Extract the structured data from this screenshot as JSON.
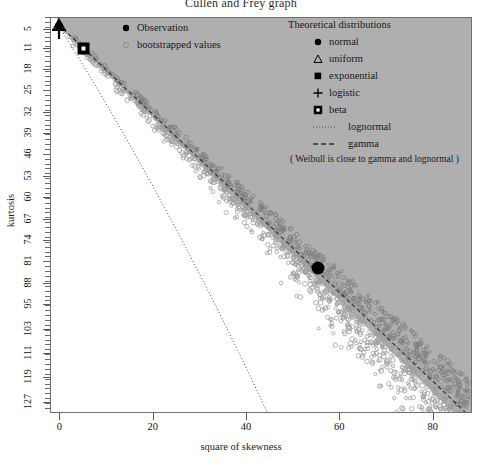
{
  "chart_data": {
    "type": "scatter",
    "title": "Cullen and Frey graph",
    "xlabel": "square of skewness",
    "ylabel": "kurtosis",
    "xlim": [
      -2,
      88
    ],
    "ylim": [
      127,
      1
    ],
    "grid": false,
    "xticks": [
      0,
      20,
      40,
      60,
      80
    ],
    "yticks": [
      5,
      11,
      18,
      25,
      32,
      39,
      46,
      53,
      60,
      67,
      74,
      81,
      88,
      95,
      103,
      111,
      119,
      127
    ],
    "y_axis_inverted": true,
    "series": [
      {
        "name": "Observation",
        "type": "point",
        "marker": "filled-circle",
        "color": "#000000",
        "points": [
          [
            51.5,
            79.5
          ]
        ]
      },
      {
        "name": "bootstrapped values",
        "type": "cloud",
        "marker": "open-circle",
        "color": "#9a9a9a",
        "n_points": 1000,
        "x_range": [
          4,
          82
        ],
        "y_range": [
          6,
          112
        ],
        "description": "elongated cloud of open grey circles running from upper-left near the origin down to the lower-right, hugging the gamma line"
      },
      {
        "name": "normal",
        "type": "point",
        "marker": "filled-circle",
        "color": "#000000",
        "points": [
          [
            0,
            3
          ]
        ]
      },
      {
        "name": "uniform",
        "type": "point",
        "marker": "open-triangle",
        "color": "#000000",
        "points": [
          [
            0,
            1.8
          ]
        ]
      },
      {
        "name": "exponential",
        "type": "point",
        "marker": "filled-square",
        "color": "#000000",
        "points": [
          [
            4,
            9
          ]
        ]
      },
      {
        "name": "logistic",
        "type": "point",
        "marker": "plus",
        "color": "#000000",
        "points": [
          [
            0,
            4.2
          ]
        ]
      },
      {
        "name": "beta",
        "type": "region",
        "marker": "square-with-dot",
        "color": "#a6a6a6",
        "description": "shaded grey wedge region bounded above by the frame and below by the gamma line"
      },
      {
        "name": "lognormal",
        "type": "line",
        "linestyle": "dotted",
        "color": "#555555",
        "description": "dotted curve descending steeply from near the origin to about x=43 at the bottom axis"
      },
      {
        "name": "gamma",
        "type": "line",
        "linestyle": "dashed",
        "color": "#333333",
        "description": "dashed line running from near the origin to the lower-right corner, forming the upper edge of the bootstrap cloud"
      }
    ]
  },
  "title": "Cullen and Frey graph",
  "axes": {
    "x": {
      "label": "square of skewness",
      "ticks": [
        "0",
        "20",
        "40",
        "60",
        "80"
      ]
    },
    "y": {
      "label": "kurtosis",
      "ticks": [
        "5",
        "11",
        "18",
        "25",
        "32",
        "39",
        "46",
        "53",
        "60",
        "67",
        "74",
        "81",
        "88",
        "95",
        "103",
        "111",
        "119",
        "127"
      ]
    }
  },
  "legend_left": {
    "items": [
      {
        "label": "Observation",
        "marker": "filled-circle"
      },
      {
        "label": "bootstrapped values",
        "marker": "open-circle"
      }
    ]
  },
  "legend_right": {
    "title": "Theoretical distributions",
    "items": [
      {
        "label": "normal",
        "marker": "filled-circle"
      },
      {
        "label": "uniform",
        "marker": "open-triangle"
      },
      {
        "label": "exponential",
        "marker": "filled-square"
      },
      {
        "label": "logistic",
        "marker": "plus"
      },
      {
        "label": "beta",
        "marker": "square-with-dot"
      },
      {
        "label": "lognormal",
        "marker": "dotted-line"
      },
      {
        "label": "gamma",
        "marker": "dashed-line"
      }
    ],
    "note": "( Weibull is close to gamma and lognormal )"
  },
  "colors": {
    "beta_region": "#a6a6a6",
    "bootstrap_points": "#9a9a9a",
    "observation": "#000000",
    "frame": "#6f6f6f"
  }
}
